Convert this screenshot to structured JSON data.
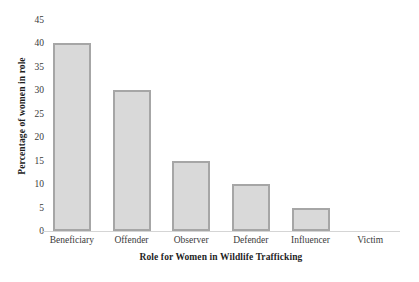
{
  "chart_data": {
    "type": "bar",
    "title": "",
    "subtitle": "",
    "xlabel": "Role for Women in Wildlife Trafficking",
    "ylabel": "Percentage of women in role",
    "categories": [
      "Beneficiary",
      "Offender",
      "Observer",
      "Defender",
      "Influencer",
      "Victim"
    ],
    "values": [
      40,
      30,
      15,
      10,
      5,
      0
    ],
    "ylim": [
      0,
      45
    ],
    "ytick_labels": [
      "45",
      "40",
      "35",
      "30",
      "25",
      "20",
      "15",
      "10",
      "5",
      "0"
    ],
    "ytick_values": [
      45,
      40,
      35,
      30,
      25,
      20,
      15,
      10,
      5,
      0
    ],
    "ytick_step": 5,
    "grid": false,
    "legend": false,
    "legend_position": "none",
    "bar_fill_color": "#d9d9d9",
    "bar_border_color": "#a6a6a6",
    "axis_line_color": "#d5d5d5",
    "background_color": "#ffffff",
    "text_color": "#2b2b2b"
  }
}
